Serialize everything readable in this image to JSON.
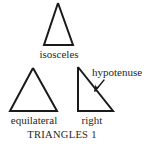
{
  "figure": {
    "caption": "TRIANGLES 1",
    "background_color": "#ffffff",
    "ink_color": "#1a1a1a",
    "width": 149,
    "height": 146
  },
  "shapes": {
    "isosceles": {
      "label": "isosceles",
      "points": "58,3 44,45 73,45 58,3"
    },
    "equilateral": {
      "label": "equilateral",
      "points": "33,68 10,111 57,111 33,68"
    },
    "right": {
      "label": "right",
      "points": "78,67 78,111 113,111 78,67"
    }
  },
  "annotations": {
    "hypotenuse": {
      "label": "hypotenuse",
      "arrow_path": "M 104 80 L 95 91"
    }
  }
}
